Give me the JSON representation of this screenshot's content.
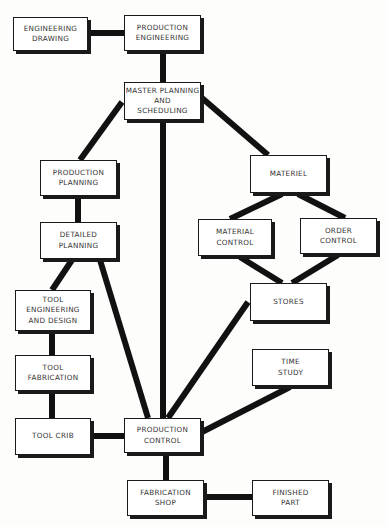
{
  "nodes": {
    "engineering_drawing": "ENGINEERING\nDRAWING",
    "production_engineering": "PRODUCTION\nENGINEERING",
    "master_planning": "MASTER PLANNING\nAND\nSCHEDULING",
    "production_planning": "PRODUCTION\nPLANNING",
    "detailed_planning": "DETAILED\nPLANNING",
    "tool_engineering": "TOOL\nENGINEERING\nAND DESIGN",
    "tool_fabrication": "TOOL\nFABRICATION",
    "tool_crib": "TOOL CRIB",
    "production_control": "PRODUCTION\nCONTROL",
    "fabrication_shop": "FABRICATION\nSHOP",
    "finished_part": "FINISHED\nPART",
    "materiel": "MATERIEL",
    "material_control": "MATERIAL\nCONTROL",
    "order_control": "ORDER\nCONTROL",
    "stores": "STORES",
    "time_study": "TIME\nSTUDY"
  },
  "edges": [
    [
      "engineering_drawing",
      "production_engineering"
    ],
    [
      "production_engineering",
      "master_planning"
    ],
    [
      "master_planning",
      "production_planning"
    ],
    [
      "master_planning",
      "materiel"
    ],
    [
      "master_planning",
      "production_control"
    ],
    [
      "production_planning",
      "detailed_planning"
    ],
    [
      "detailed_planning",
      "tool_engineering"
    ],
    [
      "detailed_planning",
      "production_control"
    ],
    [
      "tool_engineering",
      "tool_fabrication"
    ],
    [
      "tool_fabrication",
      "tool_crib"
    ],
    [
      "tool_crib",
      "production_control"
    ],
    [
      "materiel",
      "material_control"
    ],
    [
      "materiel",
      "order_control"
    ],
    [
      "material_control",
      "stores"
    ],
    [
      "order_control",
      "stores"
    ],
    [
      "stores",
      "production_control"
    ],
    [
      "time_study",
      "production_control"
    ],
    [
      "production_control",
      "fabrication_shop"
    ],
    [
      "fabrication_shop",
      "finished_part"
    ]
  ]
}
